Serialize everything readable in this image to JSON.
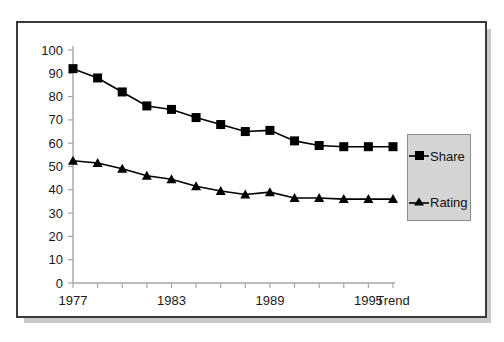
{
  "chart_data": {
    "type": "line",
    "title": "",
    "subtitle": "",
    "xlabel": "",
    "ylabel": "",
    "ylim": [
      0,
      100
    ],
    "ytick_step": 10,
    "yticks": [
      "0",
      "10",
      "20",
      "30",
      "40",
      "50",
      "60",
      "70",
      "80",
      "90",
      "100"
    ],
    "grid": false,
    "legend_position": "right",
    "x": [
      1977,
      1978,
      1979,
      1980,
      1981,
      1982,
      1983,
      1984,
      1985,
      1986,
      1987,
      1988,
      1989,
      1990
    ],
    "categories": [
      "1977",
      "1978",
      "1979",
      "1980",
      "1981",
      "1982",
      "1983",
      "1984",
      "1985",
      "1986",
      "1987",
      "1988",
      "1989",
      "Trend"
    ],
    "xtick_labels": [
      "1977",
      "1983",
      "1989",
      "1995",
      "Trend"
    ],
    "xtick_label_positions": [
      0,
      4,
      8,
      12,
      13
    ],
    "series": [
      {
        "name": "Share",
        "marker": "square",
        "color": "#000000",
        "values": [
          92,
          88,
          82,
          76,
          74.5,
          71,
          68,
          65,
          65.5,
          61,
          59,
          58.5,
          58.5,
          58.5
        ]
      },
      {
        "name": "Rating",
        "marker": "triangle",
        "color": "#000000",
        "values": [
          52.5,
          51.5,
          49,
          46,
          44.5,
          41.5,
          39.5,
          38,
          39,
          36.5,
          36.5,
          36,
          36,
          36
        ]
      }
    ]
  },
  "legend": {
    "share_label": "Share",
    "rating_label": "Rating"
  },
  "colors": {
    "series": "#000000",
    "axis": "#a6a6a6",
    "frame": "#3a3a3a",
    "legend_background": "#d4d4d4",
    "page_background": "#ffffff"
  }
}
